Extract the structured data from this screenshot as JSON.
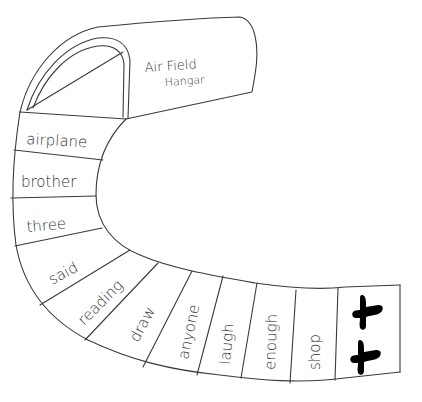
{
  "hangar": {
    "title_line1": "Air Field",
    "title_line2": "Hangar"
  },
  "spaces": [
    {
      "label": "airplane"
    },
    {
      "label": "brother"
    },
    {
      "label": "three"
    },
    {
      "label": "said"
    },
    {
      "label": "reading"
    },
    {
      "label": "draw"
    },
    {
      "label": "anyone"
    },
    {
      "label": "laugh"
    },
    {
      "label": "enough"
    },
    {
      "label": "shop"
    }
  ],
  "finish": {
    "icons": [
      "airplane-icon",
      "airplane-icon"
    ]
  },
  "colors": {
    "line": "#3a3a3a",
    "text": "#333333",
    "icon": "#000000",
    "background": "#ffffff"
  }
}
